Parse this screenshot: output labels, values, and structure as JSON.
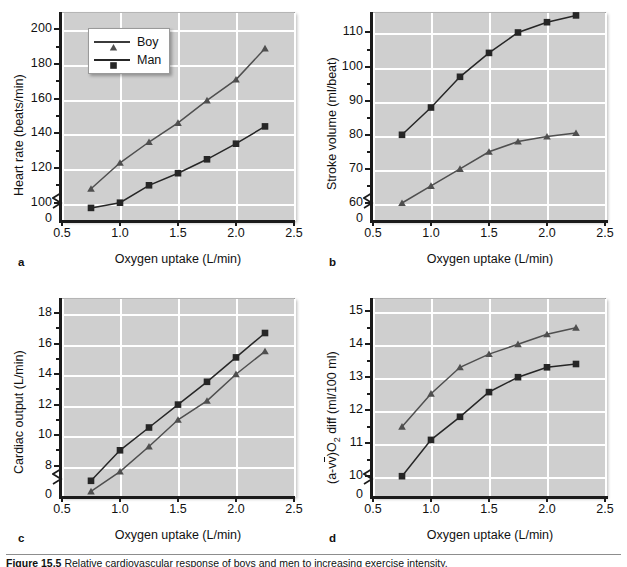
{
  "figure": {
    "caption_label": "Figure 15.5",
    "caption_text": "Relative cardiovascular response of boys and men to increasing exercise intensity."
  },
  "legend": {
    "boy": "Boy",
    "man": "Man"
  },
  "shared": {
    "xlabel": "Oxygen uptake (L/min)",
    "xticks": [
      "0.5",
      "1.0",
      "1.5",
      "2.0",
      "2.5"
    ],
    "x": [
      0.75,
      1.0,
      1.25,
      1.5,
      1.75,
      2.0,
      2.25
    ]
  },
  "colors": {
    "plot_background": "#cfcfcf",
    "gridline": "#ffffff",
    "boy_series": "#4f4f4f",
    "man_series": "#262626",
    "axis": "#1b1b1b",
    "page_background": "#ffffff"
  },
  "panels": {
    "a": {
      "letter": "a",
      "ylabel": "Heart rate (beats/min)",
      "yticks": [
        "0",
        "100",
        "120",
        "140",
        "160",
        "180",
        "200"
      ]
    },
    "b": {
      "letter": "b",
      "ylabel": "Stroke volume (ml/beat)",
      "yticks": [
        "0",
        "60",
        "70",
        "80",
        "90",
        "100",
        "110"
      ]
    },
    "c": {
      "letter": "c",
      "ylabel": "Cardiac output (L/min)",
      "yticks": [
        "0",
        "8",
        "10",
        "12",
        "14",
        "16",
        "18"
      ]
    },
    "d": {
      "letter": "d",
      "ylabel_pre": "(a-v",
      "ylabel_post": ")O",
      "ylabel_sub": "2",
      "ylabel_tail": " diff (ml/100 ml)",
      "ylabel": "(a-v̄)O2 diff (ml/100 ml)",
      "yticks": [
        "0",
        "10",
        "11",
        "12",
        "13",
        "14",
        "15"
      ]
    }
  },
  "chart_data": [
    {
      "id": "a",
      "type": "line",
      "title": "",
      "panel_letter": "a",
      "xlabel": "Oxygen uptake (L/min)",
      "ylabel": "Heart rate (beats/min)",
      "x": [
        0.75,
        1.0,
        1.25,
        1.5,
        1.75,
        2.0,
        2.25
      ],
      "xlim": [
        0.5,
        2.5
      ],
      "ylim": [
        90,
        210
      ],
      "y_axis_break": true,
      "y_break_below": 90,
      "yticks": [
        100,
        120,
        140,
        160,
        180,
        200
      ],
      "grid": true,
      "legend_position": "top-left",
      "series": [
        {
          "name": "Boy",
          "marker": "triangle",
          "values": [
            108,
            123,
            135,
            146,
            159,
            171,
            189
          ]
        },
        {
          "name": "Man",
          "marker": "square",
          "values": [
            97,
            100,
            110,
            117,
            125,
            134,
            144
          ]
        }
      ]
    },
    {
      "id": "b",
      "type": "line",
      "title": "",
      "panel_letter": "b",
      "xlabel": "Oxygen uptake (L/min)",
      "ylabel": "Stroke volume (ml/beat)",
      "x": [
        0.75,
        1.0,
        1.25,
        1.5,
        1.75,
        2.0,
        2.25
      ],
      "xlim": [
        0.5,
        2.5
      ],
      "ylim": [
        55,
        116
      ],
      "y_axis_break": true,
      "y_break_below": 55,
      "yticks": [
        60,
        70,
        80,
        90,
        100,
        110
      ],
      "grid": true,
      "legend_position": "none",
      "series": [
        {
          "name": "Boy",
          "marker": "triangle",
          "values": [
            60,
            65,
            70,
            75,
            78,
            79.5,
            80.5
          ]
        },
        {
          "name": "Man",
          "marker": "square",
          "values": [
            80,
            88,
            97,
            104,
            110,
            113,
            115
          ]
        }
      ]
    },
    {
      "id": "c",
      "type": "line",
      "title": "",
      "panel_letter": "c",
      "xlabel": "Oxygen uptake (L/min)",
      "ylabel": "Cardiac output (L/min)",
      "x": [
        0.75,
        1.0,
        1.25,
        1.5,
        1.75,
        2.0,
        2.25
      ],
      "xlim": [
        0.5,
        2.5
      ],
      "ylim": [
        6,
        19
      ],
      "y_axis_break": true,
      "y_break_below": 7,
      "yticks": [
        8,
        10,
        12,
        14,
        16,
        18
      ],
      "grid": true,
      "legend_position": "none",
      "series": [
        {
          "name": "Boy",
          "marker": "triangle",
          "values": [
            6.3,
            7.6,
            9.25,
            11.0,
            12.25,
            14.0,
            15.5
          ]
        },
        {
          "name": "Man",
          "marker": "square",
          "values": [
            7.0,
            9.0,
            10.5,
            12.0,
            13.5,
            15.1,
            16.7
          ]
        }
      ]
    },
    {
      "id": "d",
      "type": "line",
      "title": "",
      "panel_letter": "d",
      "xlabel": "Oxygen uptake (L/min)",
      "ylabel": "(a-v̄)O2 diff (ml/100 ml)",
      "x": [
        0.75,
        1.0,
        1.25,
        1.5,
        1.75,
        2.0,
        2.25
      ],
      "xlim": [
        0.5,
        2.5
      ],
      "ylim": [
        9.4,
        15.4
      ],
      "y_axis_break": true,
      "y_break_below": 9.4,
      "yticks": [
        10,
        11,
        12,
        13,
        14,
        15
      ],
      "grid": true,
      "legend_position": "none",
      "series": [
        {
          "name": "Boy",
          "marker": "triangle",
          "values": [
            11.5,
            12.5,
            13.3,
            13.7,
            14.0,
            14.3,
            14.5
          ]
        },
        {
          "name": "Man",
          "marker": "square",
          "values": [
            10.0,
            11.1,
            11.8,
            12.55,
            13.0,
            13.3,
            13.4
          ]
        }
      ]
    }
  ]
}
